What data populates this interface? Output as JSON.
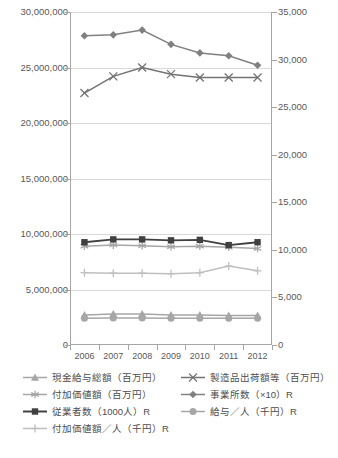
{
  "chart_data": {
    "type": "line",
    "title": "",
    "xlabel": "",
    "ylabel": "",
    "categories": [
      "2006",
      "2007",
      "2008",
      "2009",
      "2010",
      "2011",
      "2012"
    ],
    "axes": {
      "left": {
        "label": "",
        "ylim": [
          0,
          30000000
        ],
        "ticks": [
          "0",
          "5,000,000",
          "10,000,000",
          "15,000,000",
          "20,000,000",
          "25,000,000",
          "30,000,000"
        ],
        "tick_values": [
          0,
          5000000,
          10000000,
          15000000,
          20000000,
          25000000,
          30000000
        ]
      },
      "right": {
        "label": "R",
        "ylim": [
          0,
          35000
        ],
        "ticks": [
          "0",
          "5,000",
          "10,000",
          "15,000",
          "20,000",
          "25,000",
          "30,000",
          "35,000"
        ],
        "tick_values": [
          0,
          5000,
          10000,
          15000,
          20000,
          25000,
          30000,
          35000
        ]
      }
    },
    "grid": true,
    "legend_position": "bottom",
    "series": [
      {
        "name": "現金給与総額（百万円）",
        "axis": "left",
        "marker": "triangle",
        "color": "#a6a6a6",
        "values": [
          2700000,
          2800000,
          2800000,
          2700000,
          2700000,
          2650000,
          2650000
        ]
      },
      {
        "name": "付加価値額（百万円）",
        "axis": "left",
        "marker": "asterisk",
        "color": "#a6a6a6",
        "values": [
          8900000,
          9000000,
          8950000,
          8850000,
          8900000,
          8800000,
          8700000
        ]
      },
      {
        "name": "従業者数（1000人）R",
        "axis": "right",
        "marker": "square",
        "color": "#404040",
        "values": [
          10800,
          11100,
          11100,
          11000,
          11050,
          10500,
          10800
        ]
      },
      {
        "name": "付加価値額／人（千円）R",
        "axis": "right",
        "marker": "plus",
        "color": "#bfbfbf",
        "values": [
          7600,
          7550,
          7550,
          7500,
          7600,
          8300,
          7800
        ]
      },
      {
        "name": "製造品出荷額等（百万円）",
        "axis": "left",
        "marker": "x",
        "color": "#737373",
        "values": [
          22700000,
          24200000,
          25000000,
          24400000,
          24100000,
          24100000,
          24100000
        ]
      },
      {
        "name": "事業所数（×10）R",
        "axis": "right",
        "marker": "diamond",
        "color": "#808080",
        "values": [
          32500,
          32600,
          33100,
          31600,
          30700,
          30400,
          29400
        ]
      },
      {
        "name": "給与／人（千円）R",
        "axis": "right",
        "marker": "circle",
        "color": "#a6a6a6",
        "values": [
          2800,
          2850,
          2850,
          2800,
          2800,
          2800,
          2800
        ]
      }
    ]
  },
  "legend": {
    "entries": [
      {
        "label": "現金給与総額（百万円）",
        "marker": "triangle",
        "color": "#a6a6a6",
        "column": 1,
        "row": 0
      },
      {
        "label": "製造品出荷額等（百万円）",
        "marker": "x",
        "color": "#737373",
        "column": 2,
        "row": 0
      },
      {
        "label": "付加価値額（百万円）",
        "marker": "asterisk",
        "color": "#a6a6a6",
        "column": 1,
        "row": 1
      },
      {
        "label": "事業所数（×10）R",
        "marker": "diamond",
        "color": "#808080",
        "column": 2,
        "row": 1
      },
      {
        "label": "従業者数（1000人）R",
        "marker": "square",
        "color": "#404040",
        "column": 1,
        "row": 2
      },
      {
        "label": "給与／人（千円）R",
        "marker": "circle",
        "color": "#a6a6a6",
        "column": 2,
        "row": 2
      },
      {
        "label": "付加価値額／人（千円）R",
        "marker": "plus",
        "color": "#bfbfbf",
        "column": 1,
        "row": 3
      }
    ]
  },
  "caption": {
    "text": ""
  },
  "colors": {
    "axis": "#a6a6a6",
    "grid": "#d9d9d9",
    "text": "#595959",
    "background": "#ffffff"
  }
}
